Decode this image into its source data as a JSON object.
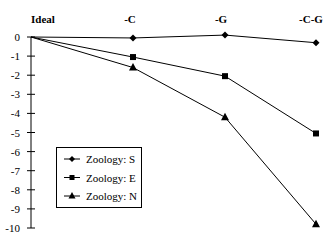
{
  "chart_data": {
    "type": "line",
    "title": "",
    "xlabel": "",
    "ylabel": "",
    "categories": [
      "Ideal",
      "-C",
      "-G",
      "-C-G"
    ],
    "ylim": [
      -10,
      0
    ],
    "yticks": [
      0,
      -1,
      -2,
      -3,
      -4,
      -5,
      -6,
      -7,
      -8,
      -9,
      -10
    ],
    "grid": false,
    "legend_position": "lower-left inside",
    "series": [
      {
        "name": "Zoology: S",
        "marker": "diamond",
        "values": [
          0,
          -0.05,
          0.1,
          -0.3
        ]
      },
      {
        "name": "Zoology: E",
        "marker": "square",
        "values": [
          0,
          -1.05,
          -2.05,
          -5.05
        ]
      },
      {
        "name": "Zoology: N",
        "marker": "triangle",
        "values": [
          0,
          -1.6,
          -4.2,
          -9.8
        ]
      }
    ]
  },
  "colors": {
    "line": "#000000",
    "background": "#ffffff"
  }
}
